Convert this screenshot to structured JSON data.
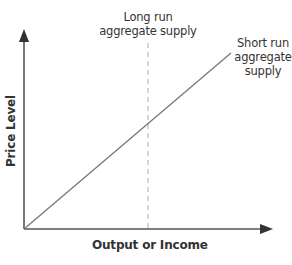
{
  "diagram": {
    "title": "",
    "axes": {
      "x_label": "Output or Income",
      "y_label": "Price Level"
    },
    "curves": {
      "long_run": {
        "label_line1": "Long run",
        "label_line2": "aggregate supply",
        "style": "dashed-vertical"
      },
      "short_run": {
        "label_line1": "Short run",
        "label_line2": "aggregate",
        "label_line3": "supply",
        "style": "solid-diagonal"
      }
    },
    "colors": {
      "axis": "#555555",
      "curve": "#777777",
      "dashed": "#bbbbbb",
      "text": "#333333",
      "background": "#ffffff"
    }
  }
}
